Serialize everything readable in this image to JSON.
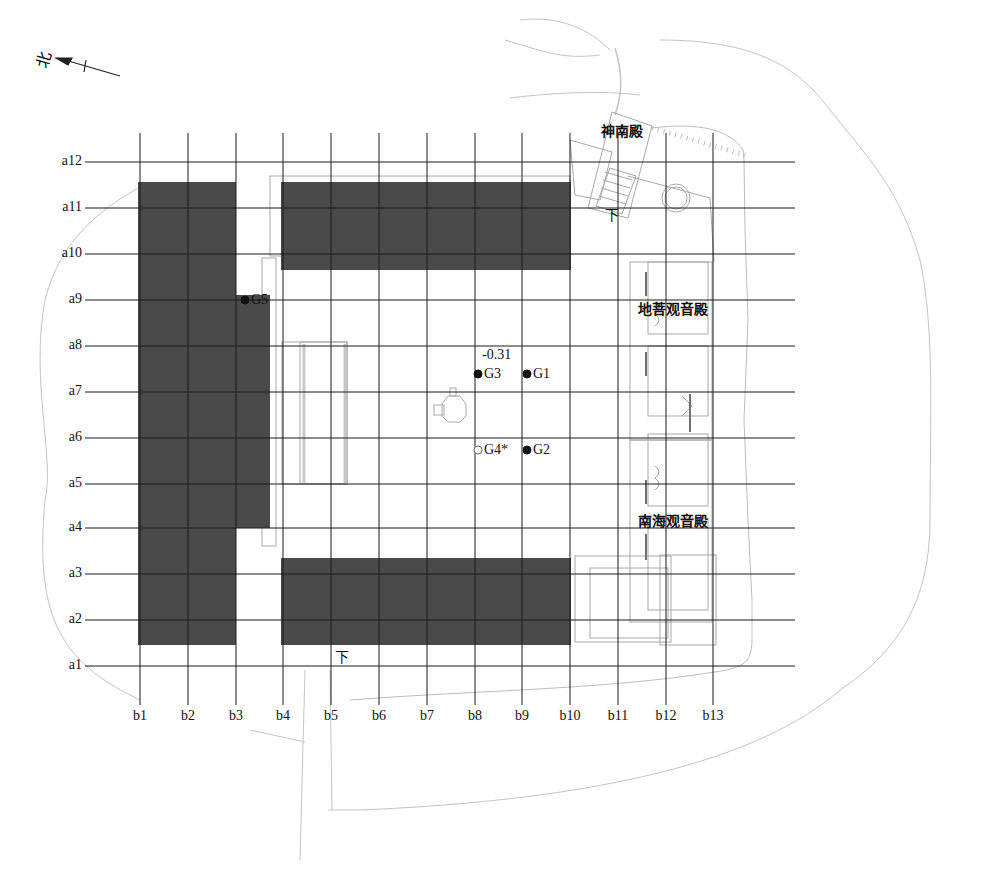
{
  "north_indicator": {
    "label": "北",
    "icon": "north-arrow-icon"
  },
  "grid": {
    "rows": [
      {
        "label": "a12",
        "y": 162
      },
      {
        "label": "a11",
        "y": 208
      },
      {
        "label": "a10",
        "y": 254
      },
      {
        "label": "a9",
        "y": 300
      },
      {
        "label": "a8",
        "y": 346
      },
      {
        "label": "a7",
        "y": 392
      },
      {
        "label": "a6",
        "y": 438
      },
      {
        "label": "a5",
        "y": 484
      },
      {
        "label": "a4",
        "y": 528
      },
      {
        "label": "a3",
        "y": 574
      },
      {
        "label": "a2",
        "y": 620
      },
      {
        "label": "a1",
        "y": 666
      }
    ],
    "columns": [
      {
        "label": "b1",
        "x": 140
      },
      {
        "label": "b2",
        "x": 188
      },
      {
        "label": "b3",
        "x": 236
      },
      {
        "label": "b4",
        "x": 283
      },
      {
        "label": "b5",
        "x": 331
      },
      {
        "label": "b6",
        "x": 379
      },
      {
        "label": "b7",
        "x": 427
      },
      {
        "label": "b8",
        "x": 475
      },
      {
        "label": "b9",
        "x": 522
      },
      {
        "label": "b10",
        "x": 570
      },
      {
        "label": "b11",
        "x": 618
      },
      {
        "label": "b12",
        "x": 666
      },
      {
        "label": "b13",
        "x": 713
      }
    ]
  },
  "halls": [
    {
      "name": "神南殿",
      "x": 601,
      "y": 124
    },
    {
      "name": "地菩观音殿",
      "x": 638,
      "y": 302
    },
    {
      "name": "南海观音殿",
      "x": 638,
      "y": 514
    }
  ],
  "stair_marks": [
    {
      "label": "下",
      "x": 605,
      "y": 208
    },
    {
      "label": "下",
      "x": 335,
      "y": 650
    }
  ],
  "elevation": {
    "value": "-0.31",
    "x": 482,
    "y": 348
  },
  "points": [
    {
      "id": "G1",
      "filled": true,
      "cx": 527,
      "cy": 374
    },
    {
      "id": "G2",
      "filled": true,
      "cx": 527,
      "cy": 450
    },
    {
      "id": "G3",
      "filled": true,
      "cx": 478,
      "cy": 374
    },
    {
      "id": "G4*",
      "filled": false,
      "cx": 478,
      "cy": 450
    },
    {
      "id": "G5",
      "filled": true,
      "cx": 245,
      "cy": 300
    }
  ],
  "colors": {
    "grid_line": "#1a1a1a",
    "shaded_block": "#4a4a4a",
    "outline": "#b8b8b8",
    "text": "#111111"
  }
}
